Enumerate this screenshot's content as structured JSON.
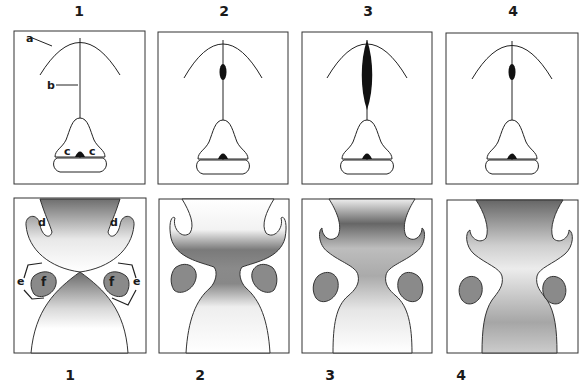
{
  "figure": {
    "top_labels": [
      "1",
      "2",
      "3",
      "4"
    ],
    "bottom_labels": [
      "1",
      "2",
      "3",
      "4"
    ],
    "annotations": {
      "a": "a",
      "b": "b",
      "c": "c",
      "d": "d",
      "e": "e",
      "f": "f"
    },
    "colors": {
      "outline": "#333333",
      "fill_dark": "#111111",
      "gradient_dark": "#707070",
      "blob_fill": "#8a8a8a",
      "background": "#ffffff"
    },
    "panels_top": [
      {
        "stage": "1",
        "spindle": "none"
      },
      {
        "stage": "2",
        "spindle": "small"
      },
      {
        "stage": "3",
        "spindle": "large"
      },
      {
        "stage": "4",
        "spindle": "small"
      }
    ],
    "panels_bottom": [
      {
        "stage": "1",
        "labels": [
          "d",
          "d",
          "e",
          "e",
          "f",
          "f"
        ]
      },
      {
        "stage": "2"
      },
      {
        "stage": "3"
      },
      {
        "stage": "4"
      }
    ]
  }
}
